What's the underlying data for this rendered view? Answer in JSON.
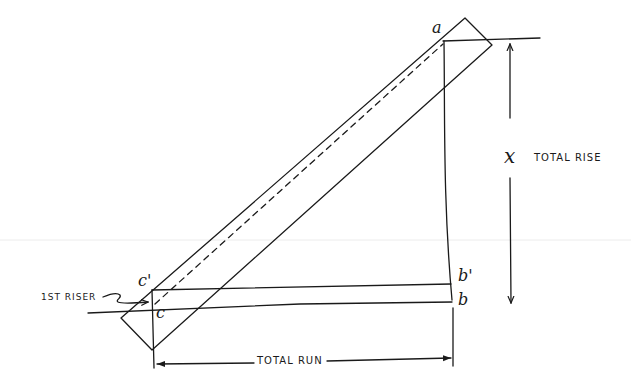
{
  "diagram": {
    "colors": {
      "ink": "#1a1a1a",
      "paper": "#ffffff",
      "faint_line": "#e6e6e6"
    },
    "points": {
      "a": "a",
      "b": "b",
      "b_prime": "b'",
      "c": "c",
      "c_prime": "c'"
    },
    "labels": {
      "x_variable": "x",
      "total_rise": "TOTAL RISE",
      "total_run": "TOTAL RUN",
      "first_riser": "1ST RISER"
    },
    "elements": [
      "stringer-board (rotated rectangle)",
      "dashed line from c' to a",
      "vertical line a-b",
      "horizontal lines c'-b' and c-b",
      "total-rise dimension arrow",
      "total-run dimension arrow",
      "1st-riser pointer arrow"
    ]
  }
}
